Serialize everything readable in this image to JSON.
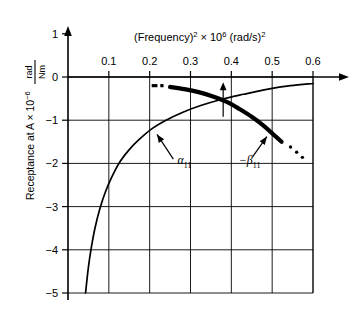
{
  "chart_data": {
    "type": "line",
    "title_parts": {
      "base1": "(Frequency)",
      "exp1": "2",
      "times": " × 10",
      "exp2": "6",
      "base2": " (rad/s)",
      "exp3": "2"
    },
    "xlabel": "(Frequency)² × 10⁶ (rad/s)²",
    "ylabel": "Receptance at A × 10",
    "ylabel_exp": "−6",
    "yunit_numerator": "rad",
    "yunit_denominator": "Nm",
    "xlim": [
      0.0,
      0.6
    ],
    "ylim": [
      -5,
      1
    ],
    "xticks": [
      0.1,
      0.2,
      0.3,
      0.4,
      0.5,
      0.6
    ],
    "xticklabels": [
      "0.1",
      "0.2",
      "0.3",
      "0.4",
      "0.5",
      "0.6"
    ],
    "yticks": [
      1,
      0,
      -1,
      -2,
      -3,
      -4,
      -5
    ],
    "yticklabels": [
      "1",
      "0",
      "−1",
      "−2",
      "−3",
      "−4",
      "−5"
    ],
    "grid": true,
    "grid_x": [
      0.1,
      0.2,
      0.3,
      0.4,
      0.5,
      0.6
    ],
    "grid_y": [
      0,
      -1,
      -2,
      -3,
      -4,
      -5
    ],
    "legend_position": "inline-annotations",
    "series": [
      {
        "name": "α₁₁",
        "label_base": "α",
        "label_sub": "11",
        "style": "thin",
        "points": [
          [
            0.043,
            -5.0
          ],
          [
            0.05,
            -4.4
          ],
          [
            0.058,
            -3.9
          ],
          [
            0.066,
            -3.5
          ],
          [
            0.078,
            -3.05
          ],
          [
            0.092,
            -2.65
          ],
          [
            0.108,
            -2.3
          ],
          [
            0.128,
            -1.95
          ],
          [
            0.15,
            -1.68
          ],
          [
            0.175,
            -1.44
          ],
          [
            0.205,
            -1.2
          ],
          [
            0.24,
            -1.0
          ],
          [
            0.28,
            -0.82
          ],
          [
            0.325,
            -0.66
          ],
          [
            0.375,
            -0.52
          ],
          [
            0.43,
            -0.4
          ],
          [
            0.49,
            -0.28
          ],
          [
            0.545,
            -0.2
          ],
          [
            0.6,
            -0.15
          ]
        ]
      },
      {
        "name": "−β₁₁",
        "label_base": "−β",
        "label_sub": "11",
        "style": "thick",
        "points": [
          [
            0.25,
            -0.23
          ],
          [
            0.285,
            -0.28
          ],
          [
            0.32,
            -0.35
          ],
          [
            0.355,
            -0.45
          ],
          [
            0.39,
            -0.58
          ],
          [
            0.42,
            -0.74
          ],
          [
            0.45,
            -0.92
          ],
          [
            0.478,
            -1.12
          ],
          [
            0.503,
            -1.33
          ],
          [
            0.523,
            -1.5
          ]
        ],
        "lead_dashes": [
          {
            "x1": 0.205,
            "x2": 0.219,
            "y": -0.2
          },
          {
            "x1": 0.226,
            "x2": 0.234,
            "y": -0.2
          }
        ],
        "trail_dots": [
          [
            0.545,
            -1.62
          ],
          [
            0.56,
            -1.74
          ],
          [
            0.574,
            -1.86
          ]
        ]
      }
    ],
    "annotations": [
      {
        "name": "alpha-arrow",
        "label": "α",
        "sub": "11",
        "text_x": 0.268,
        "text_y": -2.02,
        "arrow_from": [
          0.258,
          -1.9
        ],
        "arrow_to": [
          0.218,
          -1.33
        ]
      },
      {
        "name": "beta-arrow",
        "label": "−β",
        "sub": "11",
        "text_x": 0.418,
        "text_y": -2.02,
        "arrow_from": [
          0.452,
          -1.85
        ],
        "arrow_to": [
          0.487,
          -1.38
        ]
      },
      {
        "name": "vertical-up-arrow",
        "x": 0.38,
        "y_base": -0.92,
        "y_tip": -0.12
      }
    ]
  }
}
